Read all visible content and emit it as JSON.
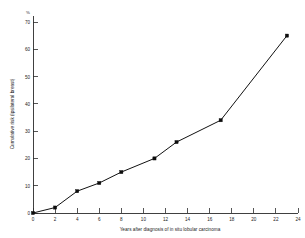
{
  "chart_data": {
    "type": "line",
    "title": "",
    "subtitle": "",
    "xlabel": "Years after diagnosis of in situ lobular carcinoma",
    "ylabel": "Cumulative risk (ipsilateral breast)",
    "yunit": "%",
    "xlim": [
      0,
      24
    ],
    "ylim": [
      0,
      70
    ],
    "grid": false,
    "legend": false,
    "legend_position": "none",
    "xticks": [
      0,
      2,
      4,
      6,
      8,
      10,
      12,
      14,
      16,
      18,
      20,
      22,
      24
    ],
    "xtick_labels": [
      "0",
      "2",
      "4",
      "6",
      "8",
      "10",
      "12",
      "14",
      "16",
      "18",
      "20",
      "22",
      "24"
    ],
    "yticks": [
      0,
      10,
      20,
      30,
      40,
      50,
      60,
      70
    ],
    "ytick_labels": [
      "0",
      "10",
      "20",
      "30",
      "40",
      "50",
      "60",
      "70"
    ],
    "x": [
      0,
      2,
      4,
      6,
      8,
      11,
      13,
      17,
      23
    ],
    "values": [
      0,
      2,
      8,
      11,
      15,
      20,
      26,
      34,
      65
    ],
    "series": [
      {
        "name": "Cumulative risk (ipsilateral breast)",
        "marker": "square",
        "color": "#0d0d0d",
        "points": [
          {
            "x": 0,
            "y": 0
          },
          {
            "x": 2,
            "y": 2
          },
          {
            "x": 4,
            "y": 8
          },
          {
            "x": 6,
            "y": 11
          },
          {
            "x": 8,
            "y": 15
          },
          {
            "x": 11,
            "y": 20
          },
          {
            "x": 13,
            "y": 26
          },
          {
            "x": 17,
            "y": 34
          },
          {
            "x": 23,
            "y": 65
          }
        ]
      }
    ],
    "annotations": []
  }
}
